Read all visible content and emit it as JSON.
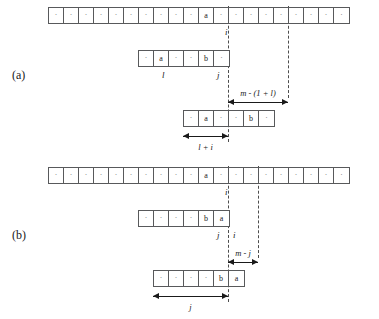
{
  "figure": {
    "panels": [
      {
        "letter": "(a)",
        "rows": [
          {
            "name": "text-string-row",
            "cells": [
              "·",
              "·",
              "·",
              "·",
              "·",
              "·",
              "·",
              "·",
              "·",
              "·",
              "a",
              "·",
              "·",
              "·",
              "·",
              "·",
              "·",
              "·",
              "·",
              "·"
            ],
            "index_labels": [
              {
                "text": "i",
                "cell": 10
              }
            ]
          },
          {
            "name": "pattern-row-before-shift",
            "cells": [
              "·",
              "a",
              "·",
              "·",
              "b",
              "·"
            ],
            "index_labels": [
              {
                "text": "l",
                "cell": 1
              },
              {
                "text": "j",
                "cell": 4
              }
            ]
          },
          {
            "name": "pattern-row-after-shift",
            "cells": [
              "·",
              "a",
              "·",
              "·",
              "b",
              "·"
            ],
            "index_labels": []
          }
        ],
        "measures": [
          {
            "name": "measure-m-minus-1-plus-l",
            "label": "m - (1 + l)"
          },
          {
            "name": "measure-l-plus-i",
            "label": "l + i"
          }
        ]
      },
      {
        "letter": "(b)",
        "rows": [
          {
            "name": "text-string-row",
            "cells": [
              "·",
              "·",
              "·",
              "·",
              "·",
              "·",
              "·",
              "·",
              "·",
              "·",
              "a",
              "·",
              "·",
              "·",
              "·",
              "·",
              "·",
              "·",
              "·",
              "·"
            ],
            "index_labels": [
              {
                "text": "i",
                "cell": 10
              }
            ]
          },
          {
            "name": "pattern-row-before-shift",
            "cells": [
              "·",
              "·",
              "·",
              "·",
              "b",
              "a"
            ],
            "index_labels": [
              {
                "text": "j",
                "cell": 4
              },
              {
                "text": "i",
                "cell": 5
              }
            ]
          },
          {
            "name": "pattern-row-after-shift",
            "cells": [
              "·",
              "·",
              "·",
              "·",
              "b",
              "a"
            ],
            "index_labels": []
          }
        ],
        "measures": [
          {
            "name": "measure-m-minus-j",
            "label": "m - j"
          },
          {
            "name": "measure-j",
            "label": "j"
          }
        ]
      }
    ],
    "colors": {
      "cell_border": "#58595b",
      "guide_line": "#4d4d4d",
      "arrow": "#1a1a1a",
      "text": "#1a1a1a",
      "background": "#ffffff"
    }
  }
}
